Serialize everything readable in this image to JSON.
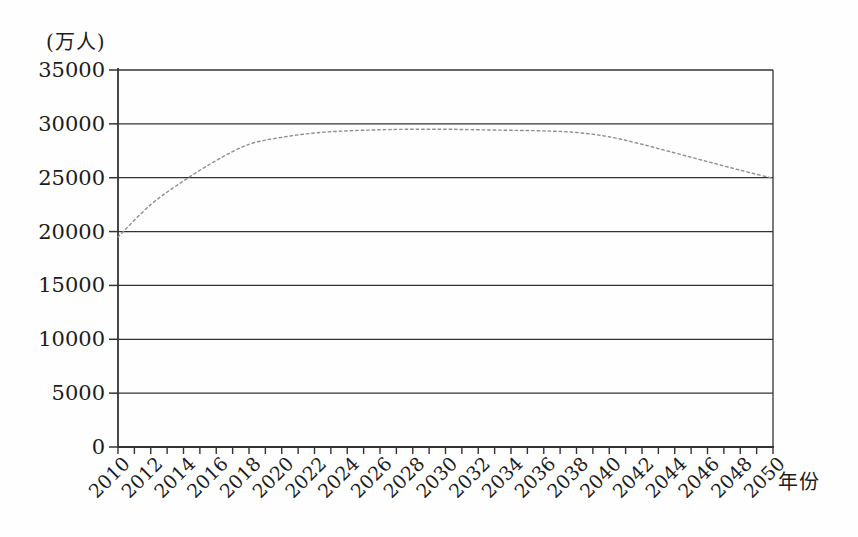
{
  "chart_data": {
    "type": "line",
    "title": "",
    "ylabel_unit": "(万人)",
    "xlabel_unit": "年份",
    "categories": [
      2010,
      2012,
      2014,
      2016,
      2018,
      2020,
      2022,
      2024,
      2026,
      2028,
      2030,
      2032,
      2034,
      2036,
      2038,
      2040,
      2042,
      2044,
      2046,
      2048,
      2050
    ],
    "series": [
      {
        "name": "population-projection",
        "values": [
          19500,
          22500,
          24700,
          26600,
          28100,
          28750,
          29150,
          29350,
          29450,
          29500,
          29500,
          29450,
          29400,
          29350,
          29200,
          28800,
          28100,
          27300,
          26500,
          25700,
          24950
        ],
        "line_style": "dotted",
        "color": "#8f8f8f"
      }
    ],
    "yticks": [
      0,
      5000,
      10000,
      15000,
      20000,
      25000,
      30000,
      35000
    ],
    "ylim": [
      0,
      35000
    ],
    "xlim": [
      2010,
      2050
    ],
    "x_minor_tick_step": 1,
    "x_label_step": 2,
    "grid": "horizontal",
    "legend": "none",
    "frame": "closed-right",
    "axis_color": "#333333",
    "text_color": "#1c1c1c",
    "background": "#fefefe"
  }
}
